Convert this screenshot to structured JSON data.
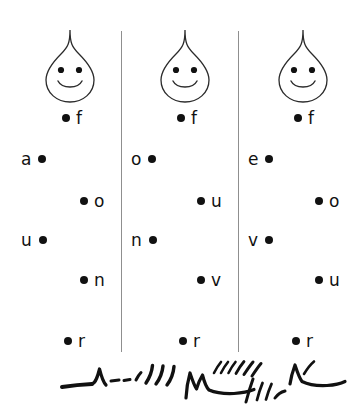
{
  "canvas": {
    "width": 362,
    "height": 416,
    "background": "#ffffff",
    "ink": "#111111",
    "divider_color": "#8f8f8f"
  },
  "columns": [
    {
      "id": "column-1",
      "face": {
        "icon": "smiling-teardrop-face",
        "x": 37,
        "y": 27
      },
      "rows": [
        {
          "letter": "f",
          "order": "dot-label",
          "x": 62,
          "y": 107
        },
        {
          "letter": "a",
          "order": "label-dot",
          "x": 21,
          "y": 148
        },
        {
          "letter": "o",
          "order": "dot-label",
          "x": 80,
          "y": 190
        },
        {
          "letter": "u",
          "order": "label-dot",
          "x": 21,
          "y": 229
        },
        {
          "letter": "n",
          "order": "dot-label",
          "x": 80,
          "y": 269
        },
        {
          "letter": "r",
          "order": "dot-label",
          "x": 64,
          "y": 330
        }
      ]
    },
    {
      "id": "column-2",
      "face": {
        "icon": "smiling-teardrop-face",
        "x": 152,
        "y": 27
      },
      "rows": [
        {
          "letter": "f",
          "order": "dot-label",
          "x": 177,
          "y": 107
        },
        {
          "letter": "o",
          "order": "label-dot",
          "x": 131,
          "y": 148
        },
        {
          "letter": "u",
          "order": "dot-label",
          "x": 197,
          "y": 190
        },
        {
          "letter": "n",
          "order": "label-dot",
          "x": 131,
          "y": 229
        },
        {
          "letter": "v",
          "order": "dot-label",
          "x": 197,
          "y": 269
        },
        {
          "letter": "r",
          "order": "dot-label",
          "x": 179,
          "y": 330
        }
      ]
    },
    {
      "id": "column-3",
      "face": {
        "icon": "smiling-teardrop-face",
        "x": 270,
        "y": 27
      },
      "rows": [
        {
          "letter": "f",
          "order": "dot-label",
          "x": 294,
          "y": 107
        },
        {
          "letter": "e",
          "order": "label-dot",
          "x": 248,
          "y": 148
        },
        {
          "letter": "o",
          "order": "dot-label",
          "x": 315,
          "y": 190
        },
        {
          "letter": "v",
          "order": "label-dot",
          "x": 248,
          "y": 229
        },
        {
          "letter": "u",
          "order": "dot-label",
          "x": 315,
          "y": 269
        },
        {
          "letter": "r",
          "order": "dot-label",
          "x": 292,
          "y": 330
        }
      ]
    }
  ],
  "annotation": {
    "icon": "handwritten-scribble",
    "description": "handwritten pen scribble"
  }
}
